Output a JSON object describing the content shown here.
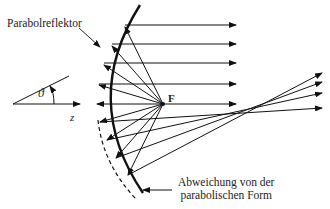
{
  "labels": {
    "reflector": "Parabolreflektor",
    "focus": "F",
    "theta": "ϑ",
    "axis_z": "z",
    "deviation_line1": "Abweichung von der",
    "deviation_line2": "parabolischen Form"
  },
  "colors": {
    "stroke": "#111111",
    "background": "#ffffff"
  },
  "geometry": {
    "focus": [
      163,
      104
    ],
    "parallel_ray_y": [
      25,
      44,
      63,
      84,
      104
    ],
    "parallel_ray_end_x": 236,
    "deviated_ray_ends": [
      [
        322,
        73
      ],
      [
        322,
        82
      ],
      [
        322,
        93
      ],
      [
        322,
        108
      ]
    ]
  }
}
